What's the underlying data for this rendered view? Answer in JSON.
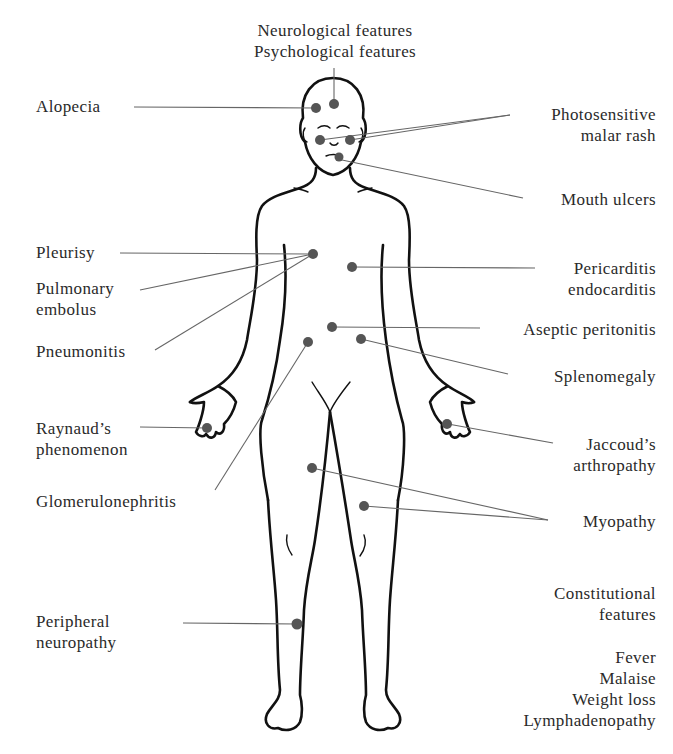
{
  "figure": {
    "colors": {
      "line": "#111111",
      "leader": "#666666",
      "dot": "#555555",
      "text": "#2a2a2a"
    }
  },
  "labels": {
    "neuro": [
      "Neurological features",
      "Psychological features"
    ],
    "alopecia": [
      "Alopecia"
    ],
    "malar": [
      "Photosensitive",
      "malar rash"
    ],
    "mouth": [
      "Mouth ulcers"
    ],
    "pleurisy": [
      "Pleurisy"
    ],
    "pe": [
      "Pulmonary",
      "embolus"
    ],
    "pneumonitis": [
      "Pneumonitis"
    ],
    "pericarditis": [
      "Pericarditis",
      "endocarditis"
    ],
    "peritonitis": [
      "Aseptic peritonitis"
    ],
    "splenomegaly": [
      "Splenomegaly"
    ],
    "raynaud": [
      "Raynaud’s",
      "phenomenon"
    ],
    "jaccoud": [
      "Jaccoud’s",
      "arthropathy"
    ],
    "glomerulo": [
      "Glomerulonephritis"
    ],
    "myopathy": [
      "Myopathy"
    ],
    "peripheral": [
      "Peripheral",
      "neuropathy"
    ],
    "constitutional": [
      "Constitutional",
      "features"
    ],
    "constitutional_list": [
      "Fever",
      "Malaise",
      "Weight loss",
      "Lymphadenopathy"
    ]
  }
}
